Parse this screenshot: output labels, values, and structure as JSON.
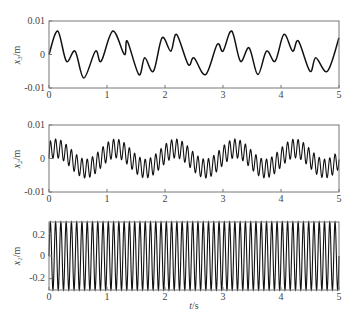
{
  "chart_data": [
    {
      "type": "line",
      "title": "",
      "xlabel": "",
      "ylabel": "x3/m",
      "ylabel_var": "x",
      "ylabel_sub": "3",
      "ylabel_unit": "/m",
      "xlim": [
        0,
        5
      ],
      "ylim": [
        -0.01,
        0.01
      ],
      "xticks": [
        "0",
        "1",
        "2",
        "3",
        "4",
        "5"
      ],
      "yticks": [
        "0.01",
        "0",
        "-0.01"
      ],
      "grid": false,
      "description": "Low-frequency multi-harmonic response, ~1 Hz fundamental with ~3.5 Hz component, amplitude ~0.007 m",
      "series": [
        {
          "name": "x3",
          "x": [
            0,
            0.15,
            0.3,
            0.45,
            0.6,
            0.8,
            0.9,
            1.1,
            1.3,
            1.35,
            1.55,
            1.65,
            1.8,
            1.95,
            2.1,
            2.2,
            2.4,
            2.5,
            2.7,
            2.9,
            3.0,
            3.15,
            3.3,
            3.45,
            3.6,
            3.75,
            3.9,
            4.05,
            4.2,
            4.3,
            4.5,
            4.6,
            4.8,
            5.0
          ],
          "values": [
            0,
            0.007,
            -0.002,
            0.001,
            -0.007,
            0.001,
            -0.002,
            0.007,
            0.0,
            0.004,
            -0.006,
            -0.001,
            -0.005,
            0.005,
            0.001,
            0.006,
            -0.003,
            -0.001,
            -0.006,
            0.003,
            0.001,
            0.007,
            -0.002,
            0.002,
            -0.006,
            0.001,
            -0.002,
            0.006,
            0.001,
            0.004,
            -0.005,
            -0.001,
            -0.005,
            0.005
          ]
        }
      ]
    },
    {
      "type": "line",
      "title": "",
      "xlabel": "",
      "ylabel": "x2/m",
      "ylabel_var": "x",
      "ylabel_sub": "2",
      "ylabel_unit": "/m",
      "xlim": [
        0,
        5
      ],
      "ylim": [
        -0.01,
        0.01
      ],
      "xticks": [
        "0",
        "1",
        "2",
        "3",
        "4",
        "5"
      ],
      "yticks": [
        "0.01",
        "0",
        "-0.01"
      ],
      "grid": false,
      "description": "~11 Hz oscillation (amplitude ~0.003 m) riding on ~1 Hz slow wave (amplitude ~0.003 m)",
      "series": [
        {
          "name": "x2",
          "carrier_freq_hz": 11,
          "carrier_amp": 0.0028,
          "envelope_freq_hz": 0.97,
          "envelope_amp": 0.003,
          "envelope_peaks_t": [
            0.1,
            1.15,
            2.15,
            3.15,
            4.2
          ]
        }
      ]
    },
    {
      "type": "line",
      "title": "",
      "xlabel": "t/s",
      "xlabel_var": "t",
      "xlabel_unit": "/s",
      "ylabel": "x1/m",
      "ylabel_var": "x",
      "ylabel_sub": "1",
      "ylabel_unit": "/m",
      "xlim": [
        0,
        5
      ],
      "ylim": [
        -0.3,
        0.3
      ],
      "xticks": [
        "0",
        "1",
        "2",
        "3",
        "4",
        "5"
      ],
      "yticks": [
        "0.2",
        "0",
        "-0.2"
      ],
      "grid": false,
      "description": "Dense ~11 Hz sinusoid with amplitude ~0.3 m filling the axes",
      "series": [
        {
          "name": "x1",
          "freq_hz": 11,
          "amplitude": 0.3
        }
      ]
    }
  ]
}
